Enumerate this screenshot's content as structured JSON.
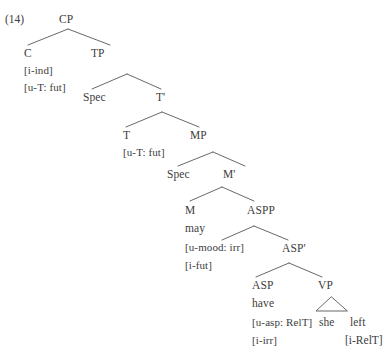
{
  "figure": {
    "example_number": "(14)",
    "type": "syntax-tree",
    "ink_color": "#3d3d3d",
    "background_color": "#ffffff"
  },
  "nodes": {
    "cp": {
      "label": "CP"
    },
    "c": {
      "label": "C",
      "features": [
        "[i-ind]",
        "[u-T: fut]"
      ]
    },
    "tp": {
      "label": "TP"
    },
    "tp_spec": {
      "label": "Spec"
    },
    "tbar": {
      "label": "T'"
    },
    "t": {
      "label": "T",
      "features": [
        "[u-T: fut]"
      ]
    },
    "mp": {
      "label": "MP"
    },
    "mp_spec": {
      "label": "Spec"
    },
    "mbar": {
      "label": "M'"
    },
    "m": {
      "label": "M",
      "word": "may",
      "features": [
        "[u-mood: irr]",
        "[i-fut]"
      ]
    },
    "aspp": {
      "label": "ASPP"
    },
    "aspbar": {
      "label": "ASP'"
    },
    "asp": {
      "label": "ASP",
      "word": "have",
      "features": [
        "[u-asp: RelT]",
        "[i-irr]"
      ]
    },
    "vp": {
      "label": "VP"
    }
  },
  "terminals": [
    {
      "text": "she"
    },
    {
      "text": "left"
    },
    {
      "text": "[i-RelT]"
    }
  ]
}
